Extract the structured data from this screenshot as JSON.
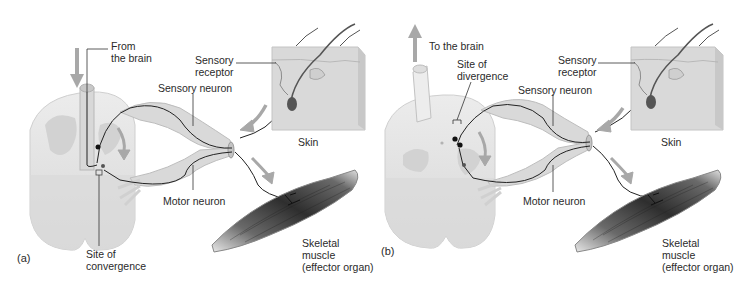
{
  "figure": {
    "panels": [
      {
        "id": "a",
        "panel_label": "(a)",
        "labels": {
          "brain": "From\nthe brain",
          "sensory_receptor": "Sensory\nreceptor",
          "sensory_neuron": "Sensory neuron",
          "skin": "Skin",
          "motor_neuron": "Motor neuron",
          "site": "Site of\nconvergence",
          "muscle": "Skeletal\nmuscle\n(effector organ)"
        },
        "brain_arrow_direction": "down"
      },
      {
        "id": "b",
        "panel_label": "(b)",
        "labels": {
          "brain": "To the brain",
          "sensory_receptor": "Sensory\nreceptor",
          "sensory_neuron": "Sensory neuron",
          "skin": "Skin",
          "motor_neuron": "Motor neuron",
          "site": "Site of\ndivergence",
          "muscle": "Skeletal\nmuscle\n(effector organ)"
        },
        "brain_arrow_direction": "up"
      }
    ],
    "colors": {
      "spinal_cord": "#e6e6e6",
      "grey_matter": "#cfcfcf",
      "nerve": "#d9d9d9",
      "skin": "#dcdcdc",
      "muscle": "#4a4a4a",
      "arrow": "#a8a8a8",
      "neuron_line": "#222222"
    }
  }
}
